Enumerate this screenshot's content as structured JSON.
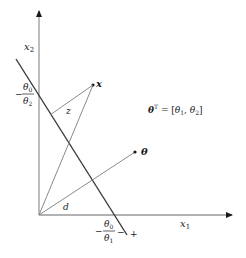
{
  "diagram": {
    "axes": {
      "x_label": "x",
      "x_label_sub": "1",
      "y_label": "x",
      "y_label_sub": "2"
    },
    "vectors": {
      "x_label": "x",
      "theta_label": "θ"
    },
    "segments": {
      "z_label": "z",
      "d_label": "d"
    },
    "intercepts": {
      "y_intercept_num": "θ",
      "y_intercept_num_sub": "0",
      "y_intercept_den": "θ",
      "y_intercept_den_sub": "2",
      "y_intercept_sign": "−",
      "x_intercept_num": "θ",
      "x_intercept_num_sub": "0",
      "x_intercept_den": "θ",
      "x_intercept_den_sub": "1",
      "x_intercept_sign": "−"
    },
    "side_signs": {
      "minus": "−",
      "plus": "+"
    },
    "equation": {
      "lhs": "θ",
      "lhs_sup": "T",
      "eq": " = [",
      "t1": "θ",
      "t1_sub": "1",
      "comma": ", ",
      "t2": "θ",
      "t2_sub": "2",
      "close": "]"
    },
    "colors": {
      "axis": "#9a9a9a",
      "decision_line": "#3a3a3a",
      "vectors": "#8a8a8a",
      "text": "#1a1a1a"
    }
  }
}
